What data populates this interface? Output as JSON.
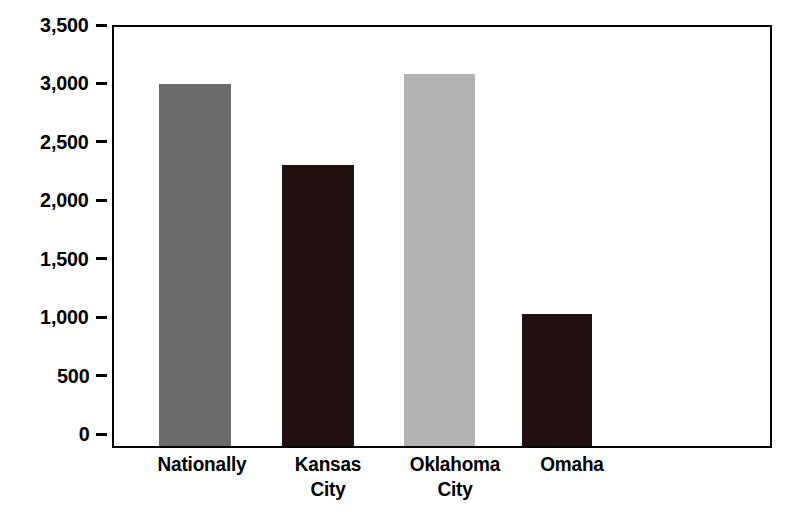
{
  "chart_data": {
    "type": "bar",
    "title": "",
    "subtitle": "",
    "xlabel": "",
    "ylabel": "",
    "categories": [
      "Nationally",
      "Kansas City",
      "Oklahoma City",
      "Omaha"
    ],
    "values": [
      3020,
      2350,
      3110,
      1100
    ],
    "series": [
      {
        "name": "",
        "values": [
          3020,
          2350,
          3110,
          1100
        ]
      }
    ],
    "bar_colors": [
      "#6b6b6b",
      "#231112",
      "#b3b3b3",
      "#231112"
    ],
    "ylim": [
      0,
      3500
    ],
    "ytick_values": [
      3500,
      3000,
      2500,
      2000,
      1500,
      1000,
      500,
      0
    ],
    "ytick_labels": [
      "3,500",
      "3,000",
      "2,500",
      "2,000",
      "1,500",
      "1,000",
      "500",
      "0"
    ],
    "grid": false,
    "legend": null,
    "legend_position": "none",
    "annotations": []
  },
  "axes": {
    "y": {
      "ticks": [
        {
          "label": "3,500",
          "value": 3500
        },
        {
          "label": "3,000",
          "value": 3000
        },
        {
          "label": "2,500",
          "value": 2500
        },
        {
          "label": "2,000",
          "value": 2000
        },
        {
          "label": "1,500",
          "value": 1500
        },
        {
          "label": "1,000",
          "value": 1000
        },
        {
          "label": "500",
          "value": 500
        },
        {
          "label": "0",
          "value": 0
        }
      ]
    },
    "x": {
      "ticks": [
        {
          "lines": [
            "Nationally"
          ]
        },
        {
          "lines": [
            "Kansas",
            "City"
          ]
        },
        {
          "lines": [
            "Oklahoma",
            "City"
          ]
        },
        {
          "lines": [
            "Omaha"
          ]
        }
      ]
    }
  },
  "bars": [
    {
      "category": "Nationally",
      "label_lines": [
        "Nationally"
      ],
      "value": 3020,
      "color": "#6b6b6b"
    },
    {
      "category": "Kansas City",
      "label_lines": [
        "Kansas",
        "City"
      ],
      "value": 2350,
      "color": "#231112"
    },
    {
      "category": "Oklahoma City",
      "label_lines": [
        "Oklahoma",
        "City"
      ],
      "value": 3110,
      "color": "#b3b3b3"
    },
    {
      "category": "Omaha",
      "label_lines": [
        "Omaha"
      ],
      "value": 1100,
      "color": "#231112"
    }
  ],
  "style": {
    "background": "#ffffff",
    "frame_color": "#000000",
    "text_color": "#000000"
  }
}
